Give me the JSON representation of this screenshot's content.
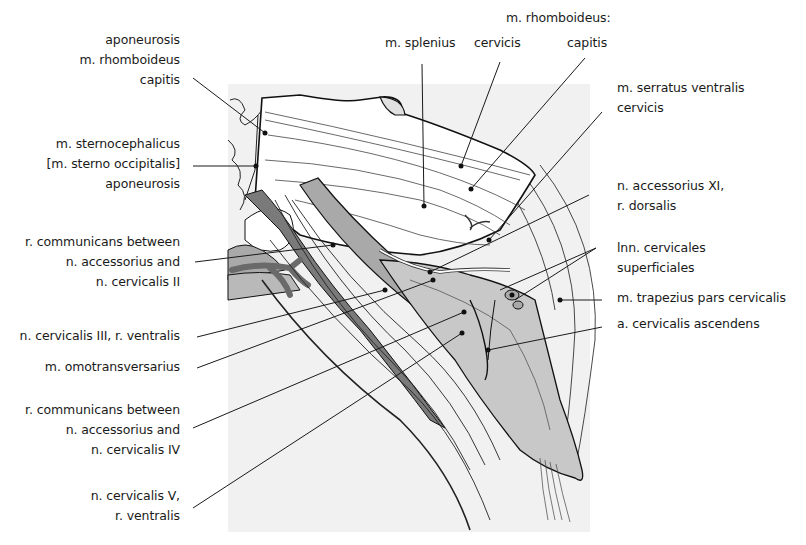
{
  "figure": {
    "colors": {
      "background_panel": "#f1f1f1",
      "muscle_light": "#c8c8c8",
      "muscle_mid": "#a9a9a9",
      "vessel_dark": "#7a7a7a",
      "line": "#1a1a1a"
    }
  },
  "labels_left": [
    {
      "id": "aponeurosis-rhomboideus",
      "lines": [
        "aponeurosis",
        "m. rhomboideus",
        "capitis"
      ]
    },
    {
      "id": "sternocephalicus",
      "lines": [
        "m. sternocephalicus",
        "[m. sterno occipitalis]",
        "aponeurosis"
      ]
    },
    {
      "id": "r-communicans-ii",
      "lines": [
        "r. communicans between",
        "n. accessorius and",
        "n. cervicalis II"
      ]
    },
    {
      "id": "n-cervicalis-iii",
      "lines": [
        "n. cervicalis III, r. ventralis"
      ]
    },
    {
      "id": "omotransversarius",
      "lines": [
        "m. omotransversarius"
      ]
    },
    {
      "id": "r-communicans-iv",
      "lines": [
        "r. communicans between",
        "n. accessorius and",
        "n. cervicalis IV"
      ]
    },
    {
      "id": "n-cervicalis-v",
      "lines": [
        "n. cervicalis V,",
        "r. ventralis"
      ]
    }
  ],
  "labels_top": [
    {
      "id": "splenius",
      "lines": [
        "m. splenius"
      ]
    },
    {
      "id": "rhomboideus-heading",
      "lines": [
        "m. rhomboideus:"
      ]
    },
    {
      "id": "rhomboideus-cervicis",
      "lines": [
        "cervicis"
      ]
    },
    {
      "id": "rhomboideus-capitis",
      "lines": [
        "capitis"
      ]
    }
  ],
  "labels_right": [
    {
      "id": "serratus",
      "lines": [
        "m. serratus ventralis",
        "cervicis"
      ]
    },
    {
      "id": "accessorius-xi",
      "lines": [
        "n. accessorius XI,",
        "r. dorsalis"
      ]
    },
    {
      "id": "lnn-cervicales",
      "lines": [
        "lnn. cervicales",
        "superficiales"
      ]
    },
    {
      "id": "trapezius",
      "lines": [
        "m. trapezius  pars cervicalis"
      ]
    },
    {
      "id": "cervicalis-ascendens",
      "lines": [
        "a. cervicalis ascendens"
      ]
    }
  ]
}
